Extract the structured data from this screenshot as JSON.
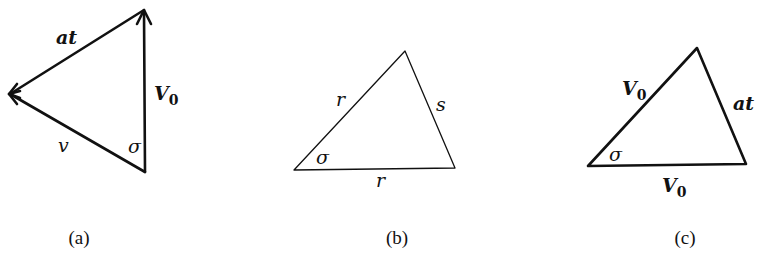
{
  "figure": {
    "panels": [
      {
        "id": "a",
        "caption": "(a)",
        "vertices": {
          "top": [
            144,
            10
          ],
          "left": [
            9,
            94
          ],
          "bottom": [
            145,
            172
          ]
        },
        "labels": {
          "at": "at",
          "v0": "V",
          "v0_sub": "0",
          "v": "v",
          "sigma": "σ"
        },
        "arrows": [
          "bottom→top (V0)",
          "top→left (at)",
          "bottom→left (v)"
        ]
      },
      {
        "id": "b",
        "caption": "(b)",
        "vertices": {
          "top": [
            405,
            51
          ],
          "left": [
            294,
            170
          ],
          "right": [
            455,
            168
          ]
        },
        "labels": {
          "r_side": "r",
          "s": "s",
          "r_base": "r",
          "sigma": "σ"
        }
      },
      {
        "id": "c",
        "caption": "(c)",
        "vertices": {
          "top": [
            697,
            48
          ],
          "left": [
            588,
            166
          ],
          "right": [
            746,
            164
          ]
        },
        "labels": {
          "v0_side": "V",
          "v0_side_sub": "0",
          "at": "at",
          "v0_base": "V",
          "v0_base_sub": "0",
          "sigma": "σ"
        }
      }
    ]
  }
}
